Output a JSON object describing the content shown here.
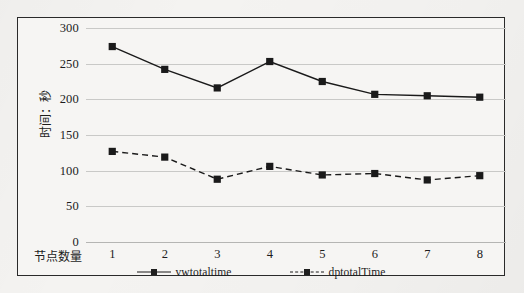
{
  "chart_data": {
    "type": "line",
    "title": "",
    "xlabel": "节点数量",
    "ylabel": "时间：秒",
    "categories": [
      "1",
      "2",
      "3",
      "4",
      "5",
      "6",
      "7",
      "8"
    ],
    "x": [
      1,
      2,
      3,
      4,
      5,
      6,
      7,
      8
    ],
    "ylim": [
      0,
      300
    ],
    "xlim": [
      0.5,
      8.5
    ],
    "yticks": [
      0,
      50,
      100,
      150,
      200,
      250,
      300
    ],
    "grid": true,
    "legend_position": "bottom",
    "series": [
      {
        "name": "vwtotaltime",
        "values": [
          274,
          242,
          216,
          253,
          225,
          207,
          205,
          203
        ],
        "color": "#1a1a1a",
        "line_style": "solid",
        "marker": "square"
      },
      {
        "name": "dptotalTime",
        "values": [
          127,
          119,
          88,
          106,
          94,
          96,
          87,
          93
        ],
        "color": "#1a1a1a",
        "line_style": "dashed",
        "marker": "square"
      }
    ]
  },
  "axes": {
    "y_tick_labels": [
      "300",
      "250",
      "200",
      "150",
      "100",
      "50",
      "0"
    ],
    "x_tick_labels": [
      "1",
      "2",
      "3",
      "4",
      "5",
      "6",
      "7",
      "8"
    ],
    "y_title": "时间：秒",
    "x_title": "节点数量"
  },
  "legend": {
    "items": [
      {
        "label": "vwtotaltime",
        "style": "solid"
      },
      {
        "label": "dptotalTime",
        "style": "dashed"
      }
    ]
  },
  "colors": {
    "series": "#1a1a1a",
    "gridline": "#c9c9c7",
    "frame": "#2a2a2a",
    "page_background": "#f3f2f0",
    "plot_background": "#f6f5f3"
  }
}
